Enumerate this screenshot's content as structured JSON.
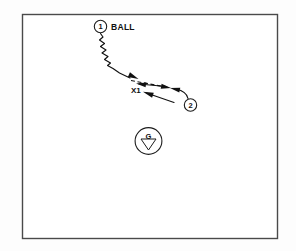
{
  "diagram": {
    "kind": "play-diagram",
    "background_color": "#ffffff",
    "ink_color": "#111111",
    "border_color": "#4a4a4a",
    "field": {
      "x": 22,
      "y": 14,
      "width": 255,
      "height": 224
    },
    "players": [
      {
        "id": "player-1",
        "label": "1",
        "cx": 100.5,
        "cy": 26.5,
        "r": 6.2,
        "annotation": "BALL",
        "annotation_x": 111,
        "annotation_y": 29.5
      },
      {
        "id": "player-2",
        "label": "2",
        "cx": 190.5,
        "cy": 105.0,
        "r": 6.2
      }
    ],
    "defender": {
      "id": "defender-x1",
      "label": "X1",
      "x": 131,
      "y": 93
    },
    "goalie": {
      "id": "goalie-g",
      "label": "G",
      "cx": 148.5,
      "cy": 141.0,
      "r": 13.4,
      "label_y": 136.0,
      "triangle": "141.0,139.0 156.0,139.0 148.5,150.0"
    },
    "paths": [
      {
        "id": "dribble-path",
        "style": "wavy",
        "semantic": "dribble-with-ball",
        "points": "100.5,33.5 103.0,37.0 99.5,40.0 104.5,43.5 100.5,46.5 106.0,50.0 102.0,53.0 108.0,56.5 104.5,59.5 110.5,63.0 107.5,65.5 113.0,68.5 119.5,73.0 130.0,78.0",
        "arrow": {
          "tip_x": 138.5,
          "tip_y": 79.0,
          "angle_deg": 24,
          "length": 10.5,
          "width": 5.2
        }
      },
      {
        "id": "pass-path",
        "style": "dashed",
        "semantic": "pass-to-player-2",
        "points": "131.0,80.5 168.5,87.5",
        "arrow": {
          "tip_x": 171.0,
          "tip_y": 88.0,
          "angle_deg": 10,
          "length": 10.0,
          "width": 5.0
        }
      },
      {
        "id": "cut-path-upper",
        "style": "solid",
        "semantic": "player-cut-upper",
        "points": "166.0,86.5 139.0,84.0",
        "arrow": {
          "tip_x": 136.0,
          "tip_y": 83.5,
          "angle_deg": 188,
          "length": 10.0,
          "width": 5.0
        }
      },
      {
        "id": "cut-path-lower",
        "style": "solid",
        "semantic": "player-cut-lower",
        "points": "174.0,102.5 146.5,93.0",
        "arrow": {
          "tip_x": 143.0,
          "tip_y": 91.8,
          "angle_deg": 199,
          "length": 10.5,
          "width": 5.2
        }
      },
      {
        "id": "player-2-run",
        "style": "solid-curve",
        "semantic": "player-2-run-path",
        "d": "M 188.0,98.5 C 187.0,93.0 182.5,90.5 176.0,89.0",
        "arrow": {
          "tip_x": 170.0,
          "tip_y": 88.0,
          "angle_deg": 192,
          "length": 10.0,
          "width": 5.0
        }
      }
    ]
  }
}
